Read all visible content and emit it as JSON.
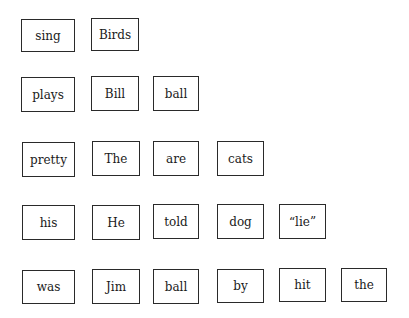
{
  "rows": [
    {
      "words": [
        "sing",
        "Birds"
      ]
    },
    {
      "words": [
        "plays",
        "Bill",
        "ball"
      ]
    },
    {
      "words": [
        "pretty",
        "The",
        "are",
        "cats"
      ]
    },
    {
      "words": [
        "his",
        "He",
        "told",
        "dog",
        "“lie”"
      ]
    },
    {
      "words": [
        "was",
        "Jim",
        "ball",
        "by",
        "hit",
        "the"
      ]
    }
  ],
  "colors": {
    "border": "#2a2a2a",
    "text": "#1a1a1a",
    "background": "#ffffff"
  }
}
